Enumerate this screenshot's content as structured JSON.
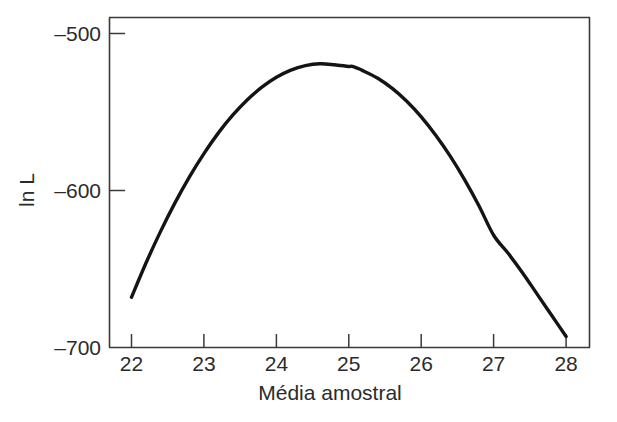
{
  "chart_data": {
    "type": "line",
    "title": "",
    "subtitle": "",
    "xlabel": "Média amostral",
    "ylabel": "ln L",
    "xlim": [
      21.7,
      28.35
    ],
    "ylim": [
      -707,
      -488
    ],
    "grid": false,
    "legend": null,
    "annotations": [],
    "x_ticks": [
      22,
      23,
      24,
      25,
      26,
      27,
      28
    ],
    "x_tick_labels": [
      "22",
      "23",
      "24",
      "25",
      "26",
      "27",
      "28"
    ],
    "y_ticks": [
      -500,
      -600,
      -700
    ],
    "y_tick_labels": [
      "–500",
      "–600",
      "–700"
    ],
    "series": [
      {
        "name": "ln L",
        "x": [
          22.0,
          22.2,
          22.4,
          22.6,
          22.8,
          23.0,
          23.2,
          23.4,
          23.6,
          23.8,
          24.0,
          24.2,
          24.4,
          24.6,
          24.8,
          25.0,
          25.05,
          25.2,
          25.4,
          25.6,
          25.8,
          26.0,
          26.2,
          26.4,
          26.6,
          26.8,
          27.0,
          27.2,
          27.4,
          27.6,
          27.8,
          28.0
        ],
        "y": [
          -668.0,
          -646.2,
          -626.2,
          -607.9,
          -591.3,
          -576.5,
          -563.3,
          -551.9,
          -542.2,
          -534.2,
          -527.9,
          -523.3,
          -520.5,
          -519.3,
          -519.9,
          -521.0,
          -521.0,
          -523.8,
          -528.5,
          -535.0,
          -543.2,
          -553.1,
          -564.8,
          -578.1,
          -593.2,
          -610.0,
          -628.5,
          -640.0,
          -652.5,
          -666.0,
          -679.5,
          -693.0
        ]
      }
    ],
    "curve_model": {
      "shape": "downward-parabola",
      "vertex_x": 25.05,
      "vertex_y": -501.0,
      "endpoints": [
        {
          "x": 22.0,
          "y": -668.0
        },
        {
          "x": 28.0,
          "y": -693.0
        }
      ]
    }
  },
  "axes": {
    "x_title": "Média amostral",
    "y_title": "ln L"
  }
}
